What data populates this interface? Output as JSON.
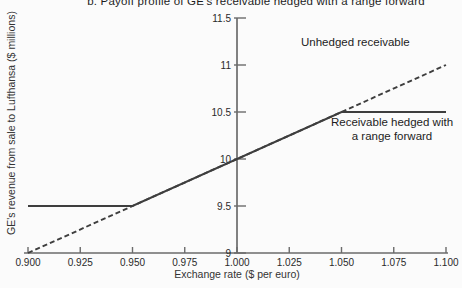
{
  "title": "b. Payoff profile of GE's receivable hedged with a range forward",
  "y_axis_title": "GE's revenue from sale to Lufthansa ($ millions)",
  "x_axis_title": "Exchange rate ($ per euro)",
  "annotations": {
    "unhedged": "Unhedged receivable",
    "hedged_line1": "Receivable hedged with",
    "hedged_line2": "a range forward"
  },
  "chart_data": {
    "type": "line",
    "title": "b. Payoff profile of GE's receivable hedged with a range forward",
    "xlabel": "Exchange rate ($ per euro)",
    "ylabel": "GE's revenue from sale to Lufthansa ($ millions)",
    "xlim": [
      0.9,
      1.1
    ],
    "ylim": [
      9,
      11.5
    ],
    "grid": false,
    "legend": "none (direct line annotations)",
    "y_axis_at_x": 1.0,
    "x_ticks": [
      {
        "v": 0.9,
        "label": "0.900"
      },
      {
        "v": 0.925,
        "label": "0.925"
      },
      {
        "v": 0.95,
        "label": "0.950"
      },
      {
        "v": 0.975,
        "label": "0.975"
      },
      {
        "v": 1.0,
        "label": "1.000"
      },
      {
        "v": 1.025,
        "label": "1.025"
      },
      {
        "v": 1.05,
        "label": "1.050"
      },
      {
        "v": 1.075,
        "label": "1.075"
      },
      {
        "v": 1.1,
        "label": "1.100"
      }
    ],
    "y_ticks": [
      {
        "v": 9,
        "label": "9"
      },
      {
        "v": 9.5,
        "label": "9.5"
      },
      {
        "v": 10,
        "label": "10"
      },
      {
        "v": 10.5,
        "label": "10.5"
      },
      {
        "v": 11,
        "label": "11"
      },
      {
        "v": 11.5,
        "label": "11.5"
      }
    ],
    "series": [
      {
        "name": "Unhedged receivable",
        "line_style": "dashed",
        "points": [
          [
            0.9,
            9.0
          ],
          [
            1.1,
            11.0
          ]
        ]
      },
      {
        "name": "Receivable hedged with a range forward",
        "line_style": "solid",
        "points": [
          [
            0.9,
            9.5
          ],
          [
            0.95,
            9.5
          ],
          [
            1.05,
            10.5
          ],
          [
            1.1,
            10.5
          ]
        ]
      }
    ],
    "colors": {
      "line": "#3e3e3e",
      "axis": "#6b6b6b",
      "text": "#2a2a2a"
    }
  }
}
